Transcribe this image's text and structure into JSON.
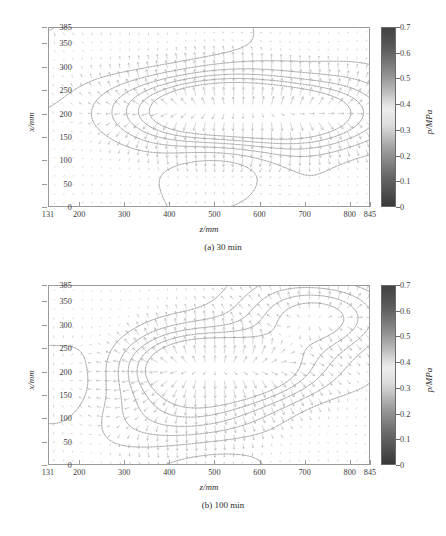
{
  "figure": {
    "panels": [
      {
        "id": "panel-a",
        "caption": "(a)  30 min",
        "xlabel": "z/mm",
        "ylabel": "x/mm",
        "colorbar_label": "p/MPa"
      },
      {
        "id": "panel-b",
        "caption": "(b)  100 min",
        "xlabel": "z/mm",
        "ylabel": "x/mm",
        "colorbar_label": "p/MPa"
      }
    ]
  },
  "chart_data": [
    {
      "type": "heatmap",
      "title": "(a)  30 min",
      "subtitle": "Pressure field with velocity vector overlay at 30 min",
      "xlabel": "z/mm",
      "ylabel": "x/mm",
      "xlim": [
        131,
        845
      ],
      "ylim": [
        0,
        385
      ],
      "xticks": [
        131,
        200,
        300,
        400,
        500,
        600,
        700,
        800,
        845
      ],
      "xticklabels": [
        "131",
        "200",
        "300",
        "400",
        "500",
        "600",
        "700",
        "800",
        "845"
      ],
      "yticks": [
        0,
        50,
        100,
        150,
        200,
        250,
        300,
        350,
        385
      ],
      "yticklabels": [
        "0",
        "50",
        "100",
        "150",
        "200",
        "250",
        "300",
        "350",
        "385"
      ],
      "grid": false,
      "legend": "none",
      "colorbar": {
        "label": "p/MPa",
        "min": 0,
        "max": 0.7,
        "ticks": [
          0,
          0.1,
          0.2,
          0.3,
          0.4,
          0.5,
          0.6,
          0.7
        ],
        "ticklabels": [
          "0",
          "0.1",
          "0.2",
          "0.3",
          "0.4",
          "0.5",
          "0.6",
          "0.7"
        ],
        "colormap": "grayscale-jet",
        "orientation": "vertical",
        "position": "right"
      },
      "overlay": {
        "type": "quiver",
        "description": "velocity vector field, regular grid of arrows",
        "grid_nx": 34,
        "grid_ny": 20
      },
      "contour_levels": [
        0.1,
        0.2,
        0.3,
        0.4,
        0.5,
        0.6
      ],
      "pressure_peaks": [
        {
          "z": 440,
          "x": 210,
          "p": 0.62
        },
        {
          "z": 600,
          "x": 207,
          "p": 0.58
        },
        {
          "z": 730,
          "x": 200,
          "p": 0.45
        }
      ],
      "pressure_lows": [
        {
          "z": 200,
          "x": 330,
          "p": 0.08
        },
        {
          "z": 440,
          "x": 340,
          "p": 0.12
        },
        {
          "z": 480,
          "x": 105,
          "p": 0.14
        }
      ]
    },
    {
      "type": "heatmap",
      "title": "(b)  100 min",
      "subtitle": "Pressure field with velocity vector overlay at 100 min",
      "xlabel": "z/mm",
      "ylabel": "x/mm",
      "xlim": [
        131,
        845
      ],
      "ylim": [
        0,
        385
      ],
      "xticks": [
        131,
        200,
        300,
        400,
        500,
        600,
        700,
        800,
        845
      ],
      "xticklabels": [
        "131",
        "200",
        "300",
        "400",
        "500",
        "600",
        "700",
        "800",
        "845"
      ],
      "yticks": [
        0,
        50,
        100,
        150,
        200,
        250,
        300,
        350,
        385
      ],
      "yticklabels": [
        "0",
        "50",
        "100",
        "150",
        "200",
        "250",
        "300",
        "350",
        "385"
      ],
      "grid": false,
      "legend": "none",
      "colorbar": {
        "label": "p/MPa",
        "min": 0,
        "max": 0.7,
        "ticks": [
          0,
          0.1,
          0.2,
          0.3,
          0.4,
          0.5,
          0.6,
          0.7
        ],
        "ticklabels": [
          "0",
          "0.1",
          "0.2",
          "0.3",
          "0.4",
          "0.5",
          "0.6",
          "0.7"
        ],
        "colormap": "grayscale-jet",
        "orientation": "vertical",
        "position": "right"
      },
      "overlay": {
        "type": "quiver",
        "description": "velocity vector field, regular grid of arrows",
        "grid_nx": 34,
        "grid_ny": 20
      },
      "contour_levels": [
        0.1,
        0.2,
        0.3,
        0.4,
        0.5,
        0.6
      ],
      "pressure_peaks": [
        {
          "z": 440,
          "x": 212,
          "p": 0.63
        },
        {
          "z": 595,
          "x": 207,
          "p": 0.55
        },
        {
          "z": 720,
          "x": 318,
          "p": 0.5
        },
        {
          "z": 445,
          "x": 105,
          "p": 0.33
        }
      ],
      "pressure_lows": [
        {
          "z": 195,
          "x": 200,
          "p": 0.07
        },
        {
          "z": 520,
          "x": 30,
          "p": 0.1
        }
      ]
    }
  ],
  "colors": {
    "axis": "#9a9a9a",
    "text": "#2b2b2b",
    "contour": "#8a8a8a",
    "arrow": "#9e9e9e",
    "cbar_dark": "#3d3d3d",
    "cbar_light": "#f2f2f2"
  }
}
